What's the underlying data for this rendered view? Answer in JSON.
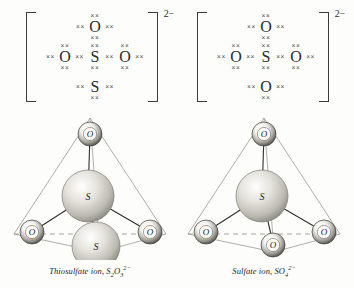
{
  "page": {
    "background_color": "#fdfdfb",
    "ink_color": "#2b2b2b"
  },
  "lewis_structures": [
    {
      "id": "thiosulfate-lewis",
      "charge": "2−",
      "dot_symbol": "××",
      "atoms": {
        "top": "O",
        "middle_left": "O",
        "center": "S",
        "middle_right": "O",
        "bottom": "S"
      }
    },
    {
      "id": "sulfate-lewis",
      "charge": "2−",
      "dot_symbol": "××",
      "atoms": {
        "top": "O",
        "middle_left": "O",
        "center": "S",
        "middle_right": "O",
        "bottom": "O"
      }
    }
  ],
  "models": [
    {
      "id": "thiosulfate-model",
      "center_atom": "S",
      "vertices": {
        "top": "O",
        "left": "O",
        "right": "O",
        "front_bottom": "S"
      },
      "caption_name": "Thiosulfate ion,",
      "caption_formula_prefix": "S",
      "caption_sub1": "2",
      "caption_mid": "O",
      "caption_sub2": "3",
      "caption_charge": "2−"
    },
    {
      "id": "sulfate-model",
      "center_atom": "S",
      "vertices": {
        "top": "O",
        "left": "O",
        "right": "O",
        "front_bottom": "O"
      },
      "caption_name": "Sulfate ion,",
      "caption_formula_prefix": "SO",
      "caption_sub1": "4",
      "caption_mid": "",
      "caption_sub2": "",
      "caption_charge": "2−"
    }
  ],
  "colors": {
    "tetrahedron_edge": "#9a9a96",
    "bond_line": "#2f2f2f",
    "sphere_large_fill": "#d8d6d0",
    "sphere_small_fill": "#f2f1ec",
    "sphere_rim": "#5a5852"
  }
}
